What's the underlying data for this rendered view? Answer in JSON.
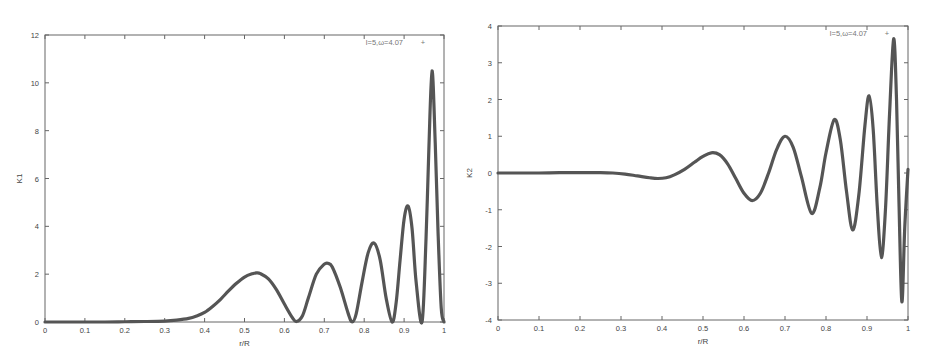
{
  "chart_data": [
    {
      "type": "line",
      "title": "",
      "xlabel": "r/R",
      "ylabel": "K1",
      "xlim": [
        0,
        1
      ],
      "ylim": [
        0,
        12
      ],
      "xticks": [
        "0",
        "0.1",
        "0.2",
        "0.3",
        "0.4",
        "0.5",
        "0.6",
        "0.7",
        "0.8",
        "0.9",
        "1"
      ],
      "yticks": [
        "0",
        "2",
        "4",
        "6",
        "8",
        "10",
        "12"
      ],
      "grid": false,
      "legend_position": "top-right",
      "series": [
        {
          "name": "l=5,ω=4.07",
          "x": [
            0,
            0.05,
            0.1,
            0.15,
            0.2,
            0.25,
            0.3,
            0.33,
            0.36,
            0.38,
            0.4,
            0.42,
            0.44,
            0.46,
            0.48,
            0.5,
            0.52,
            0.53,
            0.54,
            0.56,
            0.58,
            0.6,
            0.62,
            0.63,
            0.645,
            0.66,
            0.68,
            0.7,
            0.71,
            0.72,
            0.74,
            0.76,
            0.77,
            0.78,
            0.795,
            0.81,
            0.825,
            0.84,
            0.855,
            0.87,
            0.88,
            0.89,
            0.9,
            0.91,
            0.92,
            0.93,
            0.945,
            0.955,
            0.962,
            0.97,
            0.978,
            0.985,
            0.993,
            1.0
          ],
          "values": [
            0,
            0,
            0,
            0,
            0.01,
            0.02,
            0.04,
            0.08,
            0.15,
            0.25,
            0.4,
            0.65,
            0.95,
            1.3,
            1.62,
            1.88,
            2.02,
            2.05,
            2.02,
            1.8,
            1.35,
            0.75,
            0.18,
            0.02,
            0.25,
            1.0,
            2.0,
            2.42,
            2.45,
            2.3,
            1.45,
            0.35,
            0.0,
            0.35,
            1.7,
            2.9,
            3.3,
            2.6,
            1.0,
            0.0,
            0.8,
            2.6,
            4.3,
            4.85,
            3.9,
            1.7,
            0.0,
            3.5,
            7.2,
            10.5,
            7.5,
            3.8,
            0.6,
            0.0
          ]
        }
      ]
    },
    {
      "type": "line",
      "title": "",
      "xlabel": "r/R",
      "ylabel": "K2",
      "xlim": [
        0,
        1
      ],
      "ylim": [
        -4,
        4
      ],
      "xticks": [
        "0",
        "0.1",
        "0.2",
        "0.3",
        "0.4",
        "0.5",
        "0.6",
        "0.7",
        "0.8",
        "0.9",
        "1"
      ],
      "yticks": [
        "-4",
        "-3",
        "-2",
        "-1",
        "0",
        "1",
        "2",
        "3",
        "4"
      ],
      "grid": false,
      "legend_position": "top-right",
      "series": [
        {
          "name": "l=5,ω=4.07",
          "x": [
            0,
            0.05,
            0.1,
            0.15,
            0.2,
            0.25,
            0.28,
            0.31,
            0.34,
            0.37,
            0.39,
            0.41,
            0.43,
            0.455,
            0.48,
            0.5,
            0.52,
            0.54,
            0.56,
            0.58,
            0.6,
            0.62,
            0.64,
            0.66,
            0.68,
            0.7,
            0.72,
            0.74,
            0.765,
            0.785,
            0.8,
            0.82,
            0.835,
            0.85,
            0.865,
            0.88,
            0.895,
            0.905,
            0.915,
            0.925,
            0.935,
            0.945,
            0.955,
            0.965,
            0.972,
            0.978,
            0.985,
            0.992,
            1.0
          ],
          "values": [
            0,
            0,
            0,
            0.01,
            0.01,
            0.01,
            0.0,
            -0.03,
            -0.08,
            -0.13,
            -0.15,
            -0.13,
            -0.05,
            0.1,
            0.3,
            0.45,
            0.55,
            0.5,
            0.25,
            -0.15,
            -0.55,
            -0.75,
            -0.55,
            0.0,
            0.65,
            1.0,
            0.7,
            -0.1,
            -1.1,
            -0.4,
            0.55,
            1.45,
            0.9,
            -0.5,
            -1.55,
            -0.6,
            1.3,
            2.1,
            1.2,
            -0.9,
            -2.3,
            -1.0,
            1.6,
            3.65,
            2.0,
            -0.8,
            -3.5,
            -1.5,
            0.1
          ]
        }
      ]
    }
  ],
  "charts": {
    "left": {
      "legend": "l=5,ω=4.07",
      "xlabel": "r/R",
      "ylabel": "K1",
      "xticks": [
        "0",
        "0.1",
        "0.2",
        "0.3",
        "0.4",
        "0.5",
        "0.6",
        "0.7",
        "0.8",
        "0.9",
        "1"
      ],
      "yticks": [
        "0",
        "2",
        "4",
        "6",
        "8",
        "10",
        "12"
      ]
    },
    "right": {
      "legend": "l=5,ω=4.07",
      "xlabel": "r/R",
      "ylabel": "K2",
      "xticks": [
        "0",
        "0.1",
        "0.2",
        "0.3",
        "0.4",
        "0.5",
        "0.6",
        "0.7",
        "0.8",
        "0.9",
        "1"
      ],
      "yticks": [
        "-4",
        "-3",
        "-2",
        "-1",
        "0",
        "1",
        "2",
        "3",
        "4"
      ]
    }
  },
  "colors": {
    "curve": "#555555",
    "frame": "#666666",
    "text": "#444444",
    "background": "#ffffff"
  }
}
